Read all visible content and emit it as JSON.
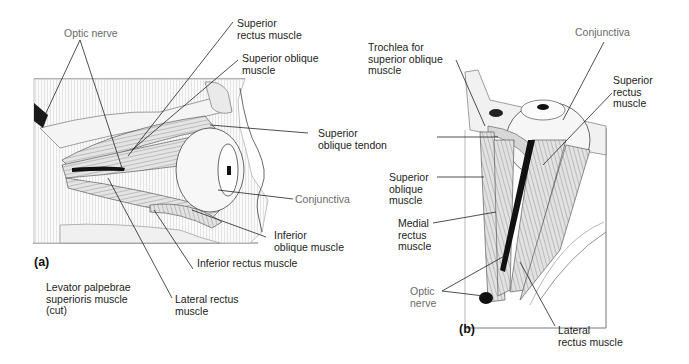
{
  "figure": {
    "panels": [
      {
        "id": "a",
        "tag": "(a)",
        "view": "lateral",
        "labels": [
          {
            "key": "optic_nerve",
            "text": "Optic nerve"
          },
          {
            "key": "superior_rectus",
            "text": "Superior\nrectus muscle"
          },
          {
            "key": "superior_oblique",
            "text": "Superior oblique\nmuscle"
          },
          {
            "key": "superior_oblique_tendon",
            "text": "Superior\noblique tendon"
          },
          {
            "key": "conjunctiva",
            "text": "Conjunctiva"
          },
          {
            "key": "inferior_oblique",
            "text": "Inferior\noblique muscle"
          },
          {
            "key": "inferior_rectus",
            "text": "Inferior rectus muscle"
          },
          {
            "key": "levator",
            "text": "Levator palpebrae\nsuperioris muscle\n(cut)"
          },
          {
            "key": "lateral_rectus",
            "text": "Lateral rectus\nmuscle"
          }
        ]
      },
      {
        "id": "b",
        "tag": "(b)",
        "view": "superior",
        "labels": [
          {
            "key": "trochlea",
            "text": "Trochlea for\nsuperior oblique\nmuscle"
          },
          {
            "key": "conjunctiva",
            "text": "Conjunctiva"
          },
          {
            "key": "superior_rectus",
            "text": "Superior\nrectus\nmuscle"
          },
          {
            "key": "superior_oblique",
            "text": "Superior\noblique\nmuscle"
          },
          {
            "key": "medial_rectus",
            "text": "Medial\nrectus\nmuscle"
          },
          {
            "key": "optic_nerve",
            "text": "Optic\nnerve"
          },
          {
            "key": "lateral_rectus",
            "text": "Lateral\nrectus muscle"
          }
        ]
      }
    ]
  },
  "colors": {
    "line": "#222222",
    "muscle_fill": "#d9d9d9",
    "muscle_stripe": "#8a8a8a",
    "nerve": "#1a1a1a",
    "bone": "#f2f2f2"
  }
}
